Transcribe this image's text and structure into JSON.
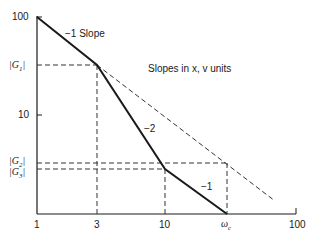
{
  "diagram": {
    "annotation": "Slopes in x, v units",
    "y_axis": {
      "ticks": [
        "100",
        "10"
      ],
      "levels": [
        "|G1|",
        "|G2|",
        "|G3|"
      ]
    },
    "x_axis": {
      "ticks": [
        "1",
        "3",
        "10",
        "ωc",
        "100"
      ]
    },
    "segments": [
      {
        "label": "−1 Slope",
        "from": "1",
        "to": "3"
      },
      {
        "label": "−2",
        "from": "3",
        "to": "10"
      },
      {
        "label": "−1",
        "from": "10",
        "to": "ωc"
      }
    ],
    "labels": {
      "y100": "100",
      "y10": "10",
      "g1": "|G",
      "g1_sub": "1",
      "g2": "|G",
      "g2_sub": "2",
      "g3": "|G",
      "g3_sub": "3",
      "x1": "1",
      "x3": "3",
      "x10": "10",
      "xwc": "ω",
      "xwc_sub": "c",
      "x100": "100",
      "slope1": "−1 Slope",
      "slope2": "−2",
      "slope3": "−1",
      "note": "Slopes in x, v units"
    },
    "colors": {
      "line": "#1a1a1a",
      "dashed": "#333333",
      "background": "#ffffff"
    }
  }
}
